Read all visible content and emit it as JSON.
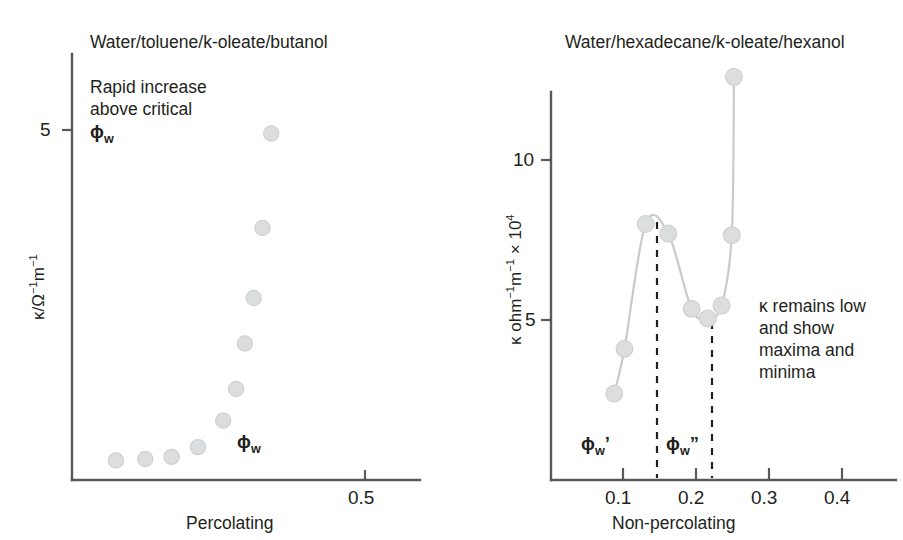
{
  "figure": {
    "background_color": "#ffffff",
    "marker_color": "#dcdddf",
    "axis_color": "#58595b",
    "text_color": "#231f20"
  },
  "left_panel": {
    "title": "Water/toluene/k-oleate/butanol",
    "note_line_1": "Rapid increase",
    "note_line_2": "above critical",
    "note_line_3": "ϕw",
    "phi_marker": "ϕw",
    "y_tick_label": "5",
    "x_tick_label": "0.5",
    "y_axis_label": "κ/Ω⁻¹m⁻¹",
    "caption": "Percolating"
  },
  "right_panel": {
    "title": "Water/hexadecane/k-oleate/hexanol",
    "note_line_1": "κ remains low",
    "note_line_2": "and show",
    "note_line_3": "maxima and",
    "note_line_4": "minima",
    "phi_prime": "ϕw’",
    "phi_double_prime": "ϕw”",
    "y_tick_labels": [
      "10",
      "5"
    ],
    "x_tick_labels": [
      "0.1",
      "0.2",
      "0.3",
      "0.4"
    ],
    "y_axis_label": "κ ohm⁻¹m⁻¹ × 10⁴",
    "caption": "Non-percolating"
  },
  "chart_data": [
    {
      "type": "scatter",
      "panel": "left",
      "title": "Water/toluene/k-oleate/butanol",
      "xlabel": "Percolating",
      "ylabel": "κ/Ω⁻¹m⁻¹",
      "xlim": [
        0.0,
        0.62
      ],
      "ylim": [
        0.0,
        11.6
      ],
      "x_ticks": [
        0.5
      ],
      "y_ticks": [
        5
      ],
      "grid": false,
      "legend": "none",
      "annotations": [
        {
          "text": "Rapid increase above critical ϕw",
          "x": 0.07,
          "y": 9.3
        },
        {
          "text": "ϕw",
          "x": 0.3,
          "y": 0.95
        }
      ],
      "x": [
        0.075,
        0.125,
        0.17,
        0.215,
        0.258,
        0.28,
        0.295,
        0.31,
        0.325,
        0.34,
        0.355,
        0.375
      ],
      "y": [
        0.28,
        0.3,
        0.33,
        0.47,
        0.85,
        1.3,
        1.95,
        2.6,
        3.6,
        4.95,
        7.45,
        8.95
      ],
      "values": [
        0.28,
        0.3,
        0.33,
        0.47,
        0.85,
        1.3,
        1.95,
        2.6,
        3.6,
        4.95,
        7.45,
        8.95
      ]
    },
    {
      "type": "line",
      "panel": "right",
      "title": "Water/hexadecane/k-oleate/hexanol",
      "xlabel": "Non-percolating",
      "ylabel": "κ ohm⁻¹m⁻¹ × 10⁴",
      "xlim": [
        0.0,
        0.47
      ],
      "ylim": [
        0.0,
        14.5
      ],
      "x_ticks": [
        0.1,
        0.2,
        0.3,
        0.4
      ],
      "y_ticks": [
        5,
        10
      ],
      "grid": false,
      "legend": "none",
      "vertical_markers": [
        {
          "label": "ϕw’",
          "x": 0.145
        },
        {
          "label": "ϕw”",
          "x": 0.216
        }
      ],
      "annotations": [
        {
          "text": "κ remains low and show maxima and minima",
          "x": 0.3,
          "y": 6.6
        }
      ],
      "x": [
        0.088,
        0.102,
        0.131,
        0.162,
        0.194,
        0.216,
        0.235,
        0.249,
        0.252
      ],
      "y": [
        2.7,
        4.1,
        8.0,
        7.7,
        5.35,
        5.05,
        5.45,
        7.65,
        12.6
      ],
      "values": [
        2.7,
        4.1,
        8.0,
        7.7,
        5.35,
        5.05,
        5.45,
        7.65,
        12.6
      ]
    }
  ]
}
